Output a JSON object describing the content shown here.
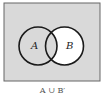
{
  "diagram": {
    "type": "venn",
    "sets": [
      {
        "label": "A",
        "shaded": true
      },
      {
        "label": "B",
        "shaded": false
      }
    ],
    "intersection_shaded": true,
    "universe_shaded": true,
    "shade_color": "#d9d9d9",
    "outline_color": "#1a1a1a",
    "caption": "A ∪ B′"
  }
}
